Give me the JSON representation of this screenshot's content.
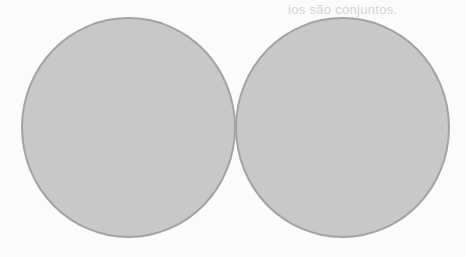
{
  "bleed_text": "ios são conjuntos.",
  "diagram": {
    "type": "two-circles-tangent",
    "circles": [
      {
        "id": "left",
        "fill": "#c8c8c8",
        "stroke": "#a3a3a3"
      },
      {
        "id": "right",
        "fill": "#c8c8c8",
        "stroke": "#a3a3a3"
      }
    ]
  }
}
